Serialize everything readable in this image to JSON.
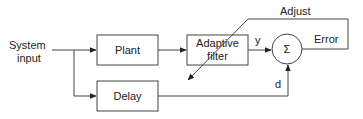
{
  "diagram": {
    "type": "block-diagram",
    "title": "",
    "inputs": {
      "system_input_line1": "System",
      "system_input_line2": "input"
    },
    "blocks": {
      "plant": "Plant",
      "delay": "Delay",
      "adaptive_filter_line1": "Adaptive",
      "adaptive_filter_line2": "filter",
      "sum": "Σ"
    },
    "signals": {
      "y": "y",
      "d": "d",
      "error": "Error",
      "adjust": "Adjust"
    },
    "colors": {
      "stroke": "#444444",
      "text": "#222222",
      "background": "#ffffff"
    },
    "edges": [
      {
        "from": "System input",
        "to": "Plant"
      },
      {
        "from": "System input",
        "to": "Delay"
      },
      {
        "from": "Plant",
        "to": "Adaptive filter"
      },
      {
        "from": "Adaptive filter",
        "to": "Σ",
        "label": "y"
      },
      {
        "from": "Delay",
        "to": "Σ",
        "label": "d"
      },
      {
        "from": "Σ",
        "to": "Adaptive filter",
        "label": "Error / Adjust"
      }
    ]
  }
}
